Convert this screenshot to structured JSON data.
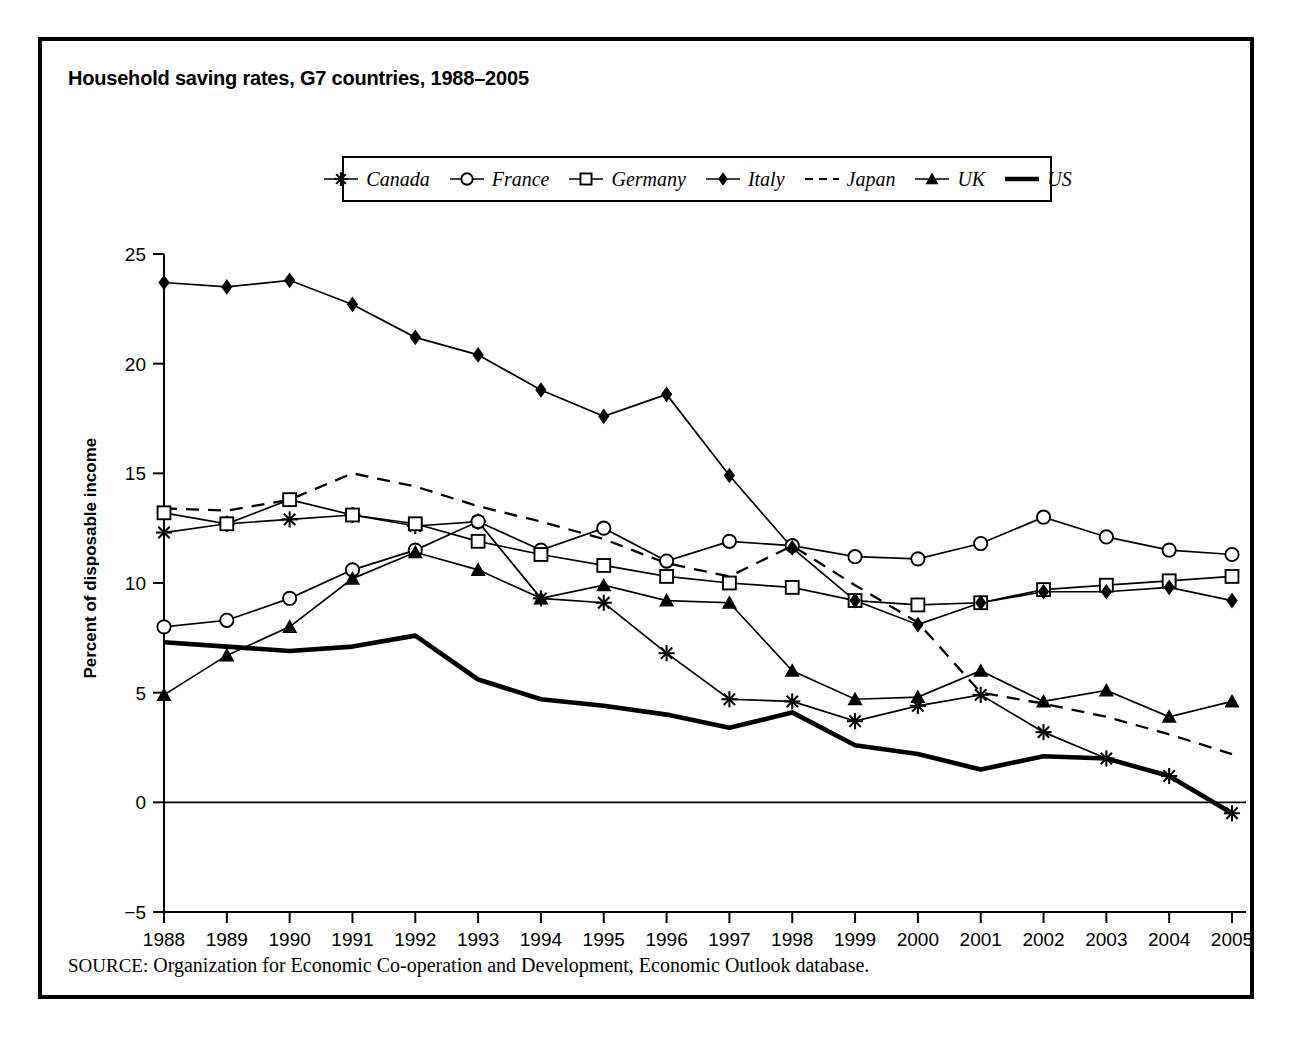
{
  "figure": {
    "title": "Household saving rates, G7 countries, 1988–2005",
    "source_keyword": "SOURCE:",
    "source_text": "Organization for Economic Co-operation and Development, Economic Outlook database."
  },
  "legend": {
    "entries": [
      {
        "label": "Canada",
        "marker": "asterisk-marker",
        "style": "solid"
      },
      {
        "label": "France",
        "marker": "open-circle-marker",
        "style": "solid"
      },
      {
        "label": "Germany",
        "marker": "open-square-marker",
        "style": "solid"
      },
      {
        "label": "Italy",
        "marker": "filled-diamond-marker",
        "style": "solid"
      },
      {
        "label": "Japan",
        "marker": "none",
        "style": "dashed"
      },
      {
        "label": "UK",
        "marker": "filled-triangle-marker",
        "style": "solid"
      },
      {
        "label": "US",
        "marker": "none",
        "style": "thick-solid"
      }
    ]
  },
  "chart_data": {
    "type": "line",
    "title": "Household saving rates, G7 countries, 1988–2005",
    "xlabel": "",
    "ylabel": "Percent of disposable income",
    "xlim": [
      1988,
      2005
    ],
    "ylim": [
      -5,
      25
    ],
    "yticks": [
      -5,
      0,
      5,
      10,
      15,
      20,
      25
    ],
    "grid": false,
    "legend_position": "top-center",
    "categories": [
      1988,
      1989,
      1990,
      1991,
      1992,
      1993,
      1994,
      1995,
      1996,
      1997,
      1998,
      1999,
      2000,
      2001,
      2002,
      2003,
      2004,
      2005
    ],
    "x": [
      1988,
      1989,
      1990,
      1991,
      1992,
      1993,
      1994,
      1995,
      1996,
      1997,
      1998,
      1999,
      2000,
      2001,
      2002,
      2003,
      2004,
      2005
    ],
    "series": [
      {
        "name": "Canada",
        "marker": "asterisk-marker",
        "style": "solid",
        "values": [
          12.3,
          12.7,
          12.9,
          13.1,
          12.6,
          12.8,
          9.3,
          9.1,
          6.8,
          4.7,
          4.6,
          3.7,
          4.4,
          4.9,
          3.2,
          2.0,
          1.2,
          -0.5
        ]
      },
      {
        "name": "France",
        "marker": "open-circle-marker",
        "style": "solid",
        "values": [
          8.0,
          8.3,
          9.3,
          10.6,
          11.5,
          12.8,
          11.5,
          12.5,
          11.0,
          11.9,
          11.7,
          11.2,
          11.1,
          11.8,
          13.0,
          12.1,
          11.5,
          11.3
        ]
      },
      {
        "name": "Germany",
        "marker": "open-square-marker",
        "style": "solid",
        "values": [
          13.2,
          12.7,
          13.8,
          13.1,
          12.7,
          11.9,
          11.3,
          10.8,
          10.3,
          10.0,
          9.8,
          9.2,
          9.0,
          9.1,
          9.7,
          9.9,
          10.1,
          10.3
        ]
      },
      {
        "name": "Italy",
        "marker": "filled-diamond-marker",
        "style": "solid",
        "values": [
          23.7,
          23.5,
          23.8,
          22.7,
          21.2,
          20.4,
          18.8,
          17.6,
          18.6,
          14.9,
          11.6,
          9.2,
          8.1,
          9.1,
          9.6,
          9.6,
          9.8,
          9.2
        ]
      },
      {
        "name": "Japan",
        "marker": "none",
        "style": "dashed",
        "values": [
          13.4,
          13.3,
          13.8,
          15.0,
          14.4,
          13.5,
          12.8,
          12.0,
          10.9,
          10.3,
          11.7,
          9.9,
          8.2,
          5.0,
          4.5,
          3.9,
          3.1,
          2.2
        ]
      },
      {
        "name": "UK",
        "marker": "filled-triangle-marker",
        "style": "solid",
        "values": [
          4.9,
          6.7,
          8.0,
          10.2,
          11.4,
          10.6,
          9.3,
          9.9,
          9.2,
          9.1,
          6.0,
          4.7,
          4.8,
          6.0,
          4.6,
          5.1,
          3.9,
          4.6
        ]
      },
      {
        "name": "US",
        "marker": "none",
        "style": "thick-solid",
        "values": [
          7.3,
          7.1,
          6.9,
          7.1,
          7.6,
          5.6,
          4.7,
          4.4,
          4.0,
          3.4,
          4.1,
          2.6,
          2.2,
          1.5,
          2.1,
          2.0,
          1.2,
          -0.5
        ]
      }
    ]
  },
  "axes": {
    "y_tick_labels": [
      "25",
      "20",
      "15",
      "10",
      "5",
      "0",
      "−5"
    ],
    "x_tick_labels": [
      "1988",
      "1989",
      "1990",
      "1991",
      "1992",
      "1993",
      "1994",
      "1995",
      "1996",
      "1997",
      "1998",
      "1999",
      "2000",
      "2001",
      "2002",
      "2003",
      "2004",
      "2005"
    ],
    "y_axis_title": "Percent of disposable income"
  },
  "colors": {
    "ink": "#000000",
    "paper": "#ffffff"
  }
}
